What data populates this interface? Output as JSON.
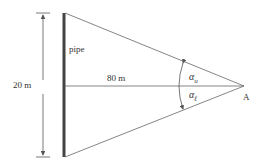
{
  "diagram": {
    "pipe_label": "pipe",
    "height_label": "20 m",
    "distance_label": "80 m",
    "angle_upper_label": "α",
    "angle_upper_sub": "u",
    "angle_lower_label": "α",
    "angle_lower_sub": "ℓ",
    "point_label": "A",
    "line_color": "#555555",
    "pipe_color": "#444444"
  }
}
